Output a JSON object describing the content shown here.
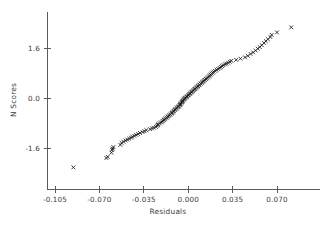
{
  "chart_data": {
    "type": "scatter",
    "title": "",
    "subtitle": "",
    "xlabel": "Residuals",
    "ylabel": "N Scores",
    "xlim": [
      -0.1225,
      0.0875
    ],
    "ylim": [
      -2.65,
      2.45
    ],
    "grid": false,
    "legend": null,
    "marker": "x",
    "marker_color": "#1a1a1a",
    "axis_color": "#5a5a5a",
    "xticks": [
      -0.105,
      -0.07,
      -0.035,
      0.0,
      0.035,
      0.07
    ],
    "xticklabels": [
      "-0.105",
      "-0.070",
      "-0.035",
      "0.000",
      "0.035",
      "0.070"
    ],
    "yticks": [
      1.6,
      0.0,
      -1.6
    ],
    "yticklabels": [
      "1.6",
      "0.0",
      "-1.6"
    ],
    "annotations": [],
    "points": [
      {
        "x": -0.0905,
        "y": -2.22
      },
      {
        "x": -0.0645,
        "y": -1.92
      },
      {
        "x": -0.0635,
        "y": -1.88
      },
      {
        "x": -0.0605,
        "y": -1.75
      },
      {
        "x": -0.06,
        "y": -1.66
      },
      {
        "x": -0.0595,
        "y": -1.62
      },
      {
        "x": -0.059,
        "y": -1.57
      },
      {
        "x": -0.0535,
        "y": -1.5
      },
      {
        "x": -0.0525,
        "y": -1.44
      },
      {
        "x": -0.051,
        "y": -1.4
      },
      {
        "x": -0.0495,
        "y": -1.36
      },
      {
        "x": -0.048,
        "y": -1.33
      },
      {
        "x": -0.0465,
        "y": -1.3
      },
      {
        "x": -0.045,
        "y": -1.27
      },
      {
        "x": -0.044,
        "y": -1.24
      },
      {
        "x": -0.0425,
        "y": -1.21
      },
      {
        "x": -0.041,
        "y": -1.18
      },
      {
        "x": -0.0395,
        "y": -1.15
      },
      {
        "x": -0.038,
        "y": -1.12
      },
      {
        "x": -0.036,
        "y": -1.09
      },
      {
        "x": -0.0345,
        "y": -1.06
      },
      {
        "x": -0.033,
        "y": -1.03
      },
      {
        "x": -0.03,
        "y": -1.0
      },
      {
        "x": -0.0285,
        "y": -0.97
      },
      {
        "x": -0.027,
        "y": -0.95
      },
      {
        "x": -0.0255,
        "y": -0.92
      },
      {
        "x": -0.0245,
        "y": -0.89
      },
      {
        "x": -0.024,
        "y": -0.86
      },
      {
        "x": -0.0235,
        "y": -0.84
      },
      {
        "x": -0.0225,
        "y": -0.81
      },
      {
        "x": -0.0215,
        "y": -0.78
      },
      {
        "x": -0.0205,
        "y": -0.76
      },
      {
        "x": -0.0198,
        "y": -0.73
      },
      {
        "x": -0.0192,
        "y": -0.7
      },
      {
        "x": -0.0185,
        "y": -0.68
      },
      {
        "x": -0.0178,
        "y": -0.65
      },
      {
        "x": -0.017,
        "y": -0.63
      },
      {
        "x": -0.0162,
        "y": -0.6
      },
      {
        "x": -0.0155,
        "y": -0.58
      },
      {
        "x": -0.0148,
        "y": -0.55
      },
      {
        "x": -0.014,
        "y": -0.53
      },
      {
        "x": -0.0133,
        "y": -0.5
      },
      {
        "x": -0.0128,
        "y": -0.48
      },
      {
        "x": -0.0122,
        "y": -0.46
      },
      {
        "x": -0.0118,
        "y": -0.43
      },
      {
        "x": -0.0112,
        "y": -0.41
      },
      {
        "x": -0.0106,
        "y": -0.38
      },
      {
        "x": -0.01,
        "y": -0.36
      },
      {
        "x": -0.0094,
        "y": -0.34
      },
      {
        "x": -0.0088,
        "y": -0.31
      },
      {
        "x": -0.0082,
        "y": -0.29
      },
      {
        "x": -0.0076,
        "y": -0.27
      },
      {
        "x": -0.007,
        "y": -0.25
      },
      {
        "x": -0.0066,
        "y": -0.22
      },
      {
        "x": -0.0062,
        "y": -0.2
      },
      {
        "x": -0.0058,
        "y": -0.18
      },
      {
        "x": -0.0054,
        "y": -0.15
      },
      {
        "x": -0.005,
        "y": -0.13
      },
      {
        "x": -0.0046,
        "y": -0.11
      },
      {
        "x": -0.0042,
        "y": -0.09
      },
      {
        "x": -0.0038,
        "y": -0.06
      },
      {
        "x": -0.0034,
        "y": -0.04
      },
      {
        "x": -0.003,
        "y": -0.02
      },
      {
        "x": -0.0024,
        "y": 0.0
      },
      {
        "x": -0.0018,
        "y": 0.02
      },
      {
        "x": -0.0012,
        "y": 0.04
      },
      {
        "x": -0.0006,
        "y": 0.06
      },
      {
        "x": 0.0,
        "y": 0.09
      },
      {
        "x": 0.0006,
        "y": 0.11
      },
      {
        "x": 0.0012,
        "y": 0.13
      },
      {
        "x": 0.0018,
        "y": 0.15
      },
      {
        "x": 0.0024,
        "y": 0.18
      },
      {
        "x": 0.003,
        "y": 0.2
      },
      {
        "x": 0.0036,
        "y": 0.22
      },
      {
        "x": 0.0042,
        "y": 0.25
      },
      {
        "x": 0.0048,
        "y": 0.27
      },
      {
        "x": 0.0054,
        "y": 0.29
      },
      {
        "x": 0.006,
        "y": 0.31
      },
      {
        "x": 0.0066,
        "y": 0.34
      },
      {
        "x": 0.0072,
        "y": 0.36
      },
      {
        "x": 0.0078,
        "y": 0.38
      },
      {
        "x": 0.0084,
        "y": 0.41
      },
      {
        "x": 0.009,
        "y": 0.43
      },
      {
        "x": 0.0098,
        "y": 0.46
      },
      {
        "x": 0.0106,
        "y": 0.48
      },
      {
        "x": 0.0112,
        "y": 0.51
      },
      {
        "x": 0.0118,
        "y": 0.53
      },
      {
        "x": 0.0124,
        "y": 0.56
      },
      {
        "x": 0.0132,
        "y": 0.58
      },
      {
        "x": 0.014,
        "y": 0.61
      },
      {
        "x": 0.0148,
        "y": 0.63
      },
      {
        "x": 0.0156,
        "y": 0.66
      },
      {
        "x": 0.0164,
        "y": 0.69
      },
      {
        "x": 0.017,
        "y": 0.72
      },
      {
        "x": 0.0176,
        "y": 0.75
      },
      {
        "x": 0.0184,
        "y": 0.78
      },
      {
        "x": 0.0192,
        "y": 0.81
      },
      {
        "x": 0.02,
        "y": 0.84
      },
      {
        "x": 0.0212,
        "y": 0.87
      },
      {
        "x": 0.0224,
        "y": 0.9
      },
      {
        "x": 0.0236,
        "y": 0.93
      },
      {
        "x": 0.0248,
        "y": 0.96
      },
      {
        "x": 0.0258,
        "y": 0.99
      },
      {
        "x": 0.0268,
        "y": 1.02
      },
      {
        "x": 0.0278,
        "y": 1.05
      },
      {
        "x": 0.029,
        "y": 1.08
      },
      {
        "x": 0.0302,
        "y": 1.1
      },
      {
        "x": 0.0315,
        "y": 1.13
      },
      {
        "x": 0.0328,
        "y": 1.16
      },
      {
        "x": 0.034,
        "y": 1.19
      },
      {
        "x": 0.0378,
        "y": 1.22
      },
      {
        "x": 0.0412,
        "y": 1.26
      },
      {
        "x": 0.0448,
        "y": 1.3
      },
      {
        "x": 0.047,
        "y": 1.35
      },
      {
        "x": 0.0492,
        "y": 1.41
      },
      {
        "x": 0.0512,
        "y": 1.46
      },
      {
        "x": 0.0532,
        "y": 1.52
      },
      {
        "x": 0.0548,
        "y": 1.58
      },
      {
        "x": 0.0564,
        "y": 1.63
      },
      {
        "x": 0.058,
        "y": 1.69
      },
      {
        "x": 0.0598,
        "y": 1.76
      },
      {
        "x": 0.0612,
        "y": 1.82
      },
      {
        "x": 0.0628,
        "y": 1.88
      },
      {
        "x": 0.0648,
        "y": 1.95
      },
      {
        "x": 0.0658,
        "y": 2.02
      },
      {
        "x": 0.07,
        "y": 2.1
      },
      {
        "x": 0.0812,
        "y": 2.26
      }
    ]
  }
}
